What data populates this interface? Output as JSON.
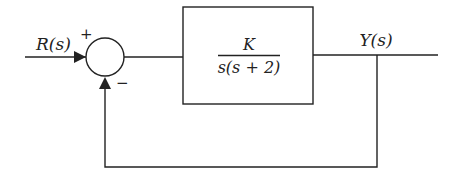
{
  "diagram": {
    "type": "feedback-control-block-diagram",
    "input_label": "R(s)",
    "output_label": "Y(s)",
    "summing_junction": {
      "plus_sign": "+",
      "minus_sign": "−"
    },
    "plant_block": {
      "numerator": "K",
      "denominator": "s(s + 2)"
    },
    "feedback": "unity negative feedback",
    "colors": {
      "stroke": "#222222",
      "background": "#ffffff"
    }
  }
}
